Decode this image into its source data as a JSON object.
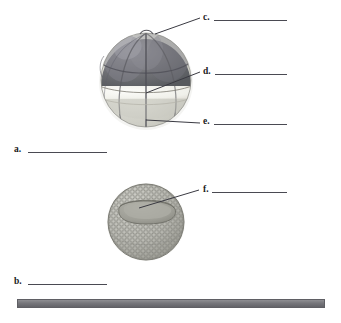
{
  "figure": {
    "background_color": "#ffffff"
  },
  "labels": [
    {
      "id": "a",
      "text": "a.",
      "x": 14,
      "y": 144,
      "rule": {
        "x": 28,
        "y": 152,
        "width": 79
      }
    },
    {
      "id": "b",
      "text": "b.",
      "x": 14,
      "y": 276,
      "rule": {
        "x": 28,
        "y": 284,
        "width": 79
      }
    },
    {
      "id": "c",
      "text": "c.",
      "x": 203,
      "y": 12,
      "rule": {
        "x": 214,
        "y": 20,
        "width": 73
      }
    },
    {
      "id": "d",
      "text": "d.",
      "x": 203,
      "y": 66,
      "rule": {
        "x": 215,
        "y": 74,
        "width": 72
      }
    },
    {
      "id": "e",
      "text": "e.",
      "x": 203,
      "y": 116,
      "rule": {
        "x": 214,
        "y": 124,
        "width": 73
      }
    },
    {
      "id": "f",
      "text": "f.",
      "x": 203,
      "y": 184,
      "rule": {
        "x": 212,
        "y": 192,
        "width": 75
      }
    }
  ],
  "leaders": [
    {
      "id": "leader-c",
      "from": [
        155,
        34
      ],
      "to": [
        200,
        18
      ]
    },
    {
      "id": "leader-d",
      "from": [
        146,
        93
      ],
      "to": [
        200,
        72
      ]
    },
    {
      "id": "leader-e",
      "from": [
        146,
        120
      ],
      "to": [
        200,
        123
      ]
    },
    {
      "id": "leader-f",
      "from": [
        139,
        208
      ],
      "to": [
        199,
        190
      ]
    }
  ],
  "structures": {
    "cleaving_embryo": {
      "name": "cleaving-embryo",
      "center": [
        146,
        80
      ],
      "radius": 45,
      "animal_pole_color": "#6e6e73",
      "equator_band_color": "#f2f2ef",
      "vegetal_pole_color": "#d6d6cf"
    },
    "blastula": {
      "name": "blastula-embryo",
      "center": [
        146,
        222
      ],
      "radius": 39,
      "cell_layer_color": "#b8b8b2",
      "cavity_color": "#a0a09a"
    }
  },
  "ground_bar": {
    "name": "ground-bar",
    "x": 17,
    "y": 299,
    "width": 308,
    "height": 9,
    "color": "#76767b"
  }
}
